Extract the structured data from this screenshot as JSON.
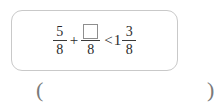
{
  "problem": {
    "left_fraction": {
      "numerator": "5",
      "denominator": "8"
    },
    "operator": "+",
    "blank_fraction": {
      "numerator": "",
      "numerator_placeholder": "blank-square",
      "denominator": "8"
    },
    "relation": "<",
    "right_mixed_number": {
      "whole": "1",
      "numerator": "3",
      "denominator": "8"
    },
    "full_expression": "5/8 + □/8 < 1 3/8"
  },
  "answer_blank": {
    "open_paren": "(",
    "close_paren": ")",
    "value": ""
  },
  "colors": {
    "card_border": "#c9c9c9",
    "text": "#2b2b2b",
    "blank_border": "#8e8e8e",
    "paren": "#7a7a7a",
    "background": "#ffffff"
  }
}
